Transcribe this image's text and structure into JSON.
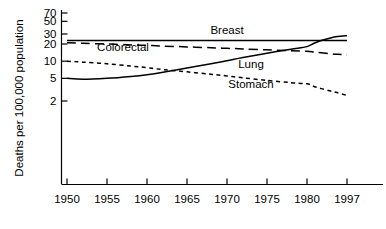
{
  "chart_data": {
    "type": "line",
    "title": "",
    "xlabel": "",
    "ylabel": "Deaths per 100,000 population",
    "yscale": "log",
    "yticks": [
      2,
      5,
      10,
      20,
      30,
      50,
      70
    ],
    "ytick_labels": [
      "2",
      "5",
      "10",
      "20",
      "30",
      "50",
      "70"
    ],
    "ylim": [
      1.6,
      85
    ],
    "xticks": [
      1950,
      1955,
      1960,
      1965,
      1970,
      1975,
      1980,
      1997
    ],
    "xtick_labels": [
      "1950",
      "1955",
      "1960",
      "1965",
      "1970",
      "1975",
      "1980",
      "1997"
    ],
    "xlim": [
      1950,
      1997
    ],
    "grid": false,
    "legend_position": "inline-annotations",
    "x": [
      1950,
      1952,
      1955,
      1958,
      1960,
      1962,
      1965,
      1968,
      1970,
      1972,
      1975,
      1978,
      1980,
      1983,
      1986,
      1990,
      1993,
      1997
    ],
    "series": [
      {
        "name": "Breast",
        "style": "solid",
        "label": "Breast",
        "values": [
          23.0,
          23.0,
          23.0,
          23.0,
          23.0,
          23.0,
          23.0,
          23.0,
          23.0,
          23.0,
          23.0,
          23.0,
          23.0,
          23.0,
          23.0,
          23.0,
          23.0,
          23.0
        ]
      },
      {
        "name": "Colorectal",
        "style": "long-dash",
        "label": "Colorectal",
        "values": [
          21.0,
          20.6,
          20.0,
          19.3,
          18.9,
          18.4,
          17.8,
          17.2,
          16.8,
          16.4,
          15.8,
          15.2,
          14.9,
          14.4,
          14.0,
          13.5,
          13.2,
          13.0
        ]
      },
      {
        "name": "Lung",
        "style": "solid",
        "label": "Lung",
        "values": [
          5.0,
          4.8,
          5.0,
          5.4,
          5.8,
          6.4,
          7.6,
          9.0,
          10.2,
          11.6,
          13.8,
          16.2,
          18.0,
          20.6,
          23.0,
          25.6,
          27.0,
          28.0
        ]
      },
      {
        "name": "Stomach",
        "style": "short-dash",
        "label": "Stomach",
        "values": [
          10.0,
          9.6,
          9.0,
          8.2,
          7.7,
          7.1,
          6.5,
          5.9,
          5.5,
          5.1,
          4.6,
          4.2,
          4.0,
          3.6,
          3.3,
          3.0,
          2.8,
          2.5
        ]
      }
    ],
    "annotations": [
      {
        "text": "Breast",
        "x": 1970,
        "y": 30.0
      },
      {
        "text": "Colorectal",
        "x": 1957,
        "y": 14.8
      },
      {
        "text": "Lung",
        "x": 1973,
        "y": 7.6
      },
      {
        "text": "Stomach",
        "x": 1973,
        "y": 3.4
      }
    ]
  }
}
